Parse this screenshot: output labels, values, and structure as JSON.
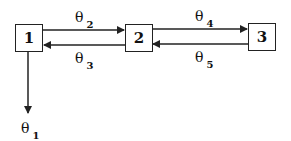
{
  "diagram": {
    "nodes": [
      {
        "id": "1",
        "label": "1"
      },
      {
        "id": "2",
        "label": "2"
      },
      {
        "id": "3",
        "label": "3"
      }
    ],
    "edges": [
      {
        "from": "1",
        "to": "2",
        "symbol": "θ",
        "index": "2"
      },
      {
        "from": "2",
        "to": "1",
        "symbol": "θ",
        "index": "3"
      },
      {
        "from": "2",
        "to": "3",
        "symbol": "θ",
        "index": "4"
      },
      {
        "from": "3",
        "to": "2",
        "symbol": "θ",
        "index": "5"
      },
      {
        "from": "1",
        "to": "out",
        "symbol": "θ",
        "index": "1"
      }
    ],
    "colors": {
      "line": "#222222",
      "background": "#ffffff"
    }
  }
}
